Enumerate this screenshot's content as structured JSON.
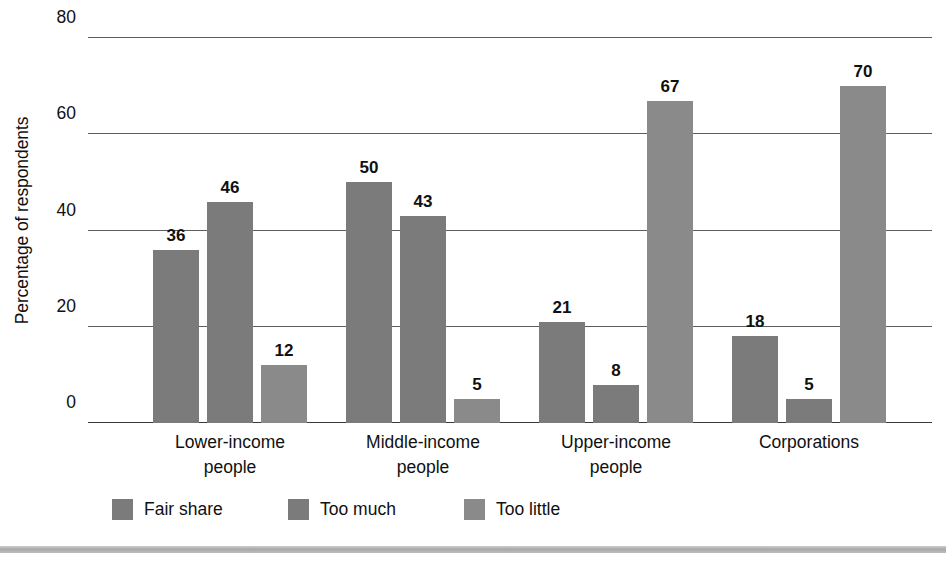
{
  "chart_data": {
    "type": "bar",
    "title": "",
    "subtitle": "",
    "xlabel": "",
    "ylabel": "Percentage of respondents",
    "categories": [
      "Lower-income\npeople",
      "Middle-income\npeople",
      "Upper-income\npeople",
      "Corporations"
    ],
    "category_lines": [
      [
        "Lower-income",
        "people"
      ],
      [
        "Middle-income",
        "people"
      ],
      [
        "Upper-income",
        "people"
      ],
      [
        "Corporations",
        ""
      ]
    ],
    "series": [
      {
        "name": "Fair share",
        "values": [
          36,
          50,
          21,
          18
        ],
        "color": "#7b7b7b"
      },
      {
        "name": "Too much",
        "values": [
          46,
          43,
          8,
          5
        ],
        "color": "#7b7b7b"
      },
      {
        "name": "Too little",
        "values": [
          12,
          5,
          67,
          70
        ],
        "color": "#8a8a8a"
      }
    ],
    "ylim": [
      0,
      80
    ],
    "yticks": [
      0,
      20,
      40,
      60,
      80
    ],
    "ytick_labels": [
      "0",
      "20",
      "40",
      "60",
      "80"
    ],
    "grid": true,
    "grid_axis": "y",
    "legend_position": "bottom-left",
    "value_labels": true,
    "data_label_values": [
      [
        36,
        46,
        12
      ],
      [
        50,
        43,
        5
      ],
      [
        21,
        8,
        67
      ],
      [
        18,
        5,
        70
      ]
    ]
  },
  "axis": {
    "y_title": "Percentage of respondents",
    "ticks": [
      {
        "value": 80,
        "label": "80"
      },
      {
        "value": 60,
        "label": "60"
      },
      {
        "value": 40,
        "label": "40"
      },
      {
        "value": 20,
        "label": "20"
      },
      {
        "value": 0,
        "label": "0"
      }
    ]
  },
  "legend": {
    "items": [
      {
        "label": "Fair share",
        "color": "#7b7b7b"
      },
      {
        "label": "Too much",
        "color": "#7b7b7b"
      },
      {
        "label": "Too little",
        "color": "#8a8a8a"
      }
    ]
  },
  "colors": {
    "series_fair_share": "#7b7b7b",
    "series_too_much": "#7b7b7b",
    "series_too_little": "#8a8a8a",
    "gridline": "#5e5e5e",
    "text": "#101010",
    "background": "#ffffff",
    "bottom_rule": "#a8a8a8"
  }
}
